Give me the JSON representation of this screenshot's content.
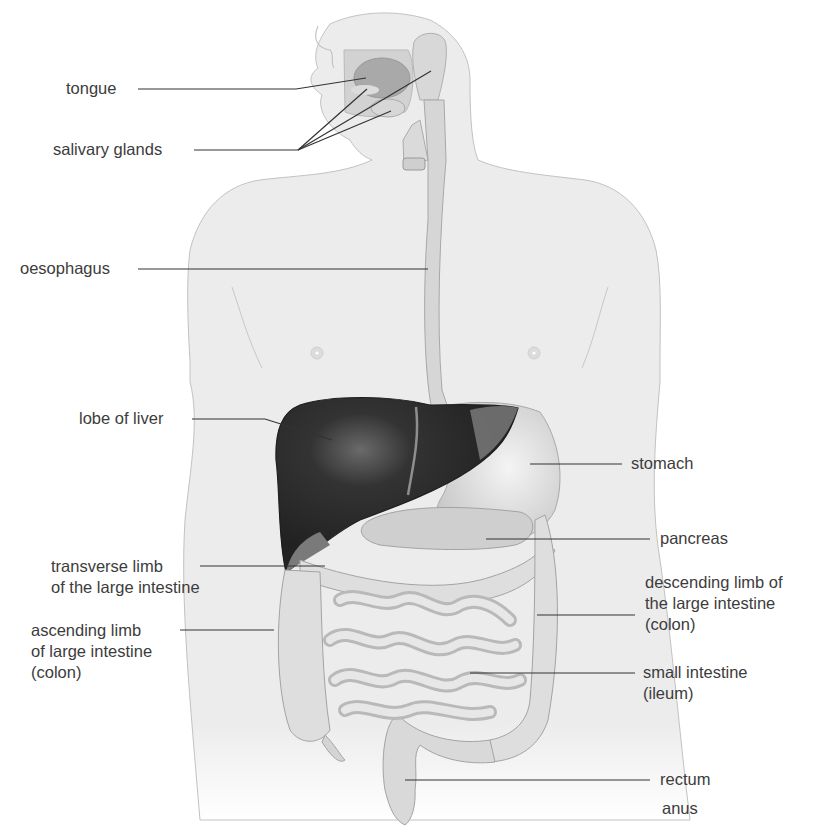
{
  "figure": {
    "colors": {
      "background": "#ffffff",
      "body_fill": "#ececec",
      "body_outline": "#b8b8b8",
      "organ_fill": "#d9d9d9",
      "organ_outline": "#9a9a9a",
      "liver": "#2b2b2b",
      "leader_line": "#333333",
      "label_text": "#3c3c3c"
    }
  },
  "labels": {
    "tongue": {
      "lines": [
        "tongue"
      ]
    },
    "salivary_glands": {
      "lines": [
        "salivary glands"
      ]
    },
    "oesophagus": {
      "lines": [
        "oesophagus"
      ]
    },
    "lobe_of_liver": {
      "lines": [
        "lobe of liver"
      ]
    },
    "stomach": {
      "lines": [
        "stomach"
      ]
    },
    "pancreas": {
      "lines": [
        "pancreas"
      ]
    },
    "transverse_limb": {
      "lines": [
        "transverse limb",
        "of the large intestine"
      ]
    },
    "descending_limb": {
      "lines": [
        "descending limb of",
        "the large intestine",
        "(colon)"
      ]
    },
    "ascending_limb": {
      "lines": [
        "ascending limb",
        "of large intestine",
        "(colon)"
      ]
    },
    "small_intestine": {
      "lines": [
        "small intestine",
        "(ileum)"
      ]
    },
    "rectum": {
      "lines": [
        "rectum"
      ]
    },
    "anus": {
      "lines": [
        "anus"
      ]
    }
  }
}
